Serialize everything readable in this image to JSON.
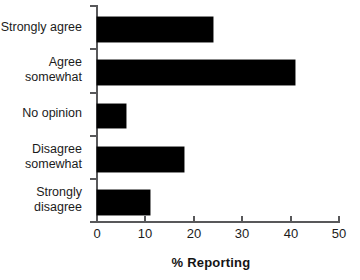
{
  "chart_data": {
    "type": "bar",
    "orientation": "horizontal",
    "title": "",
    "xlabel": "% Reporting",
    "ylabel": "",
    "categories": [
      "Strongly agree",
      "Agree\nsomewhat",
      "No opinion",
      "Disagree\nsomewhat",
      "Strongly\ndisagree"
    ],
    "values": [
      24,
      41,
      6,
      18,
      11
    ],
    "xlim": [
      0,
      50
    ],
    "xticks": [
      0,
      10,
      20,
      30,
      40,
      50
    ],
    "xtick_labels": [
      "0",
      "10",
      "20",
      "30",
      "40",
      "50"
    ],
    "grid": false,
    "legend": null,
    "bar_color": "#000000",
    "axis_color": "#58585a",
    "background": "#ffffff"
  }
}
